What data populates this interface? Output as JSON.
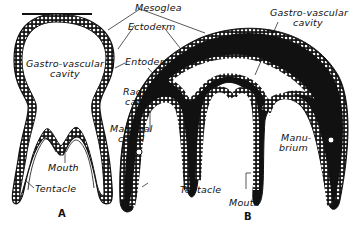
{
  "figure": {
    "panels": [
      {
        "id": "A",
        "caption": "A"
      },
      {
        "id": "B",
        "caption": "B"
      }
    ],
    "colors": {
      "ink": "#111111",
      "mesoglea_fill": "#111111",
      "background": "#ffffff",
      "cell_fill": "#ffffff"
    }
  },
  "labels": {
    "mesoglea": "Mesoglea",
    "ectoderm": "Ectoderm",
    "entoderm": "Entoderm",
    "radial_canal_1": "Radial",
    "radial_canal_2": "canal",
    "marginal_canal_1": "Marginal",
    "marginal_canal_2": "canal",
    "gv_cavity_a_1": "Gastro-vascular",
    "gv_cavity_a_2": "cavity",
    "gv_cavity_b_1": "Gastro-vascular",
    "gv_cavity_b_2": "cavity",
    "mouth_a": "Mouth",
    "tentacle_a": "Tentacle",
    "mouth_b": "Mouth",
    "tentacle_b": "Tentacle",
    "manubrium_1": "Manu-",
    "manubrium_2": "brium"
  }
}
